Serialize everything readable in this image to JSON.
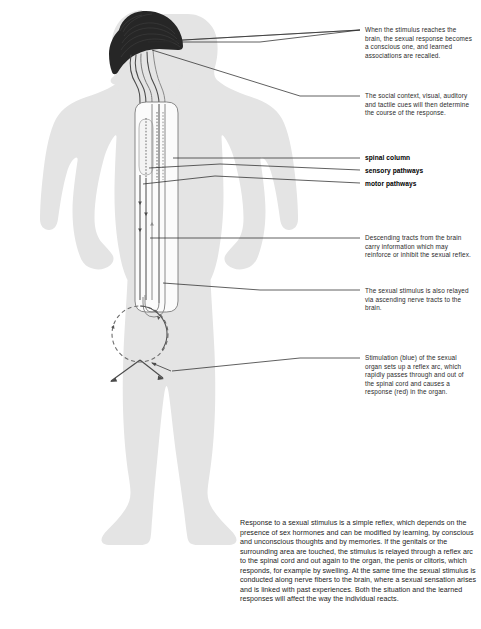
{
  "figure": {
    "body_fill": "#e4e4e4",
    "brain_fill": "#2b2b2b",
    "line_color": "#3a3a3a",
    "spine_fill": "#fbfbfb",
    "parts": [
      {
        "name": "brain",
        "description": "dark brain mass in head shown in profile"
      },
      {
        "name": "spinal-column",
        "description": "vertical tube running down torso"
      },
      {
        "name": "sensory-pathways",
        "description": "ascending nerve tracts"
      },
      {
        "name": "motor-pathways",
        "description": "descending nerve tracts"
      },
      {
        "name": "reflex-arc-circle",
        "description": "circular arc at pelvis with arrows"
      }
    ]
  },
  "labels": [
    {
      "id": "spinal-column",
      "text": "spinal column"
    },
    {
      "id": "sensory-pathways",
      "text": "sensory pathways"
    },
    {
      "id": "motor-pathways",
      "text": "motor pathways"
    }
  ],
  "annotations": [
    {
      "id": "brain-conscious",
      "text": "When the stimulus reaches the brain, the sexual response becomes a conscious one, and learned associations are recalled."
    },
    {
      "id": "social-context",
      "text": "The social context, visual, auditory and tactile cues will then determine the course of the response."
    },
    {
      "id": "descending-tracts",
      "text": "Descending tracts from the brain carry information which may reinforce or inhibit the sexual reflex."
    },
    {
      "id": "ascending-tracts",
      "text": "The sexual stimulus is also relayed via ascending nerve tracts to the brain."
    },
    {
      "id": "stimulation-reflex-arc",
      "text": "Stimulation (blue) of the sexual organ sets up a reflex arc, which rapidly passes through and out of the spinal cord and causes a response (red) in the organ."
    }
  ],
  "caption": {
    "text": "Response to a sexual stimulus is a simple reflex, which depends on the presence of sex hormones and can be modified by learning, by conscious and unconscious thoughts and by memories. If the genitals or the surrounding area are touched, the stimulus is relayed through a reflex arc to the spinal cord and out again to the organ, the penis or clitoris, which responds, for example by swelling. At the same time the sexual stimulus is conducted along nerve fibers to the brain, where a sexual sensation arises and is linked with past experiences. Both the situation and the learned responses will affect the way the individual reacts."
  }
}
